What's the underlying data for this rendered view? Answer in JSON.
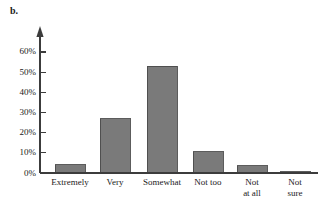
{
  "panel": {
    "label": "b."
  },
  "chart_data": {
    "type": "bar",
    "title": "",
    "subtitle": "",
    "xlabel": "",
    "ylabel": "",
    "categories": [
      "Extremely",
      "Very",
      "Somewhat",
      "Not too",
      "Not\nat all",
      "Not\nsure"
    ],
    "values": [
      4,
      27,
      53,
      10.5,
      3.5,
      0.7
    ],
    "value_labels": [
      "4%",
      "27%",
      "53%",
      "10.5%",
      "3.5%",
      "0.7%"
    ],
    "ylim": [
      0,
      65
    ],
    "ytick_values": [
      0,
      10,
      20,
      30,
      40,
      50,
      60
    ],
    "ytick_labels": [
      "0%",
      "10%",
      "20%",
      "30%",
      "40%",
      "50%",
      "60%"
    ],
    "grid": false,
    "legend": false,
    "legend_position": "none",
    "bar_color": "#7a7a7a",
    "bar_edge_color": "#4a4a4a",
    "axis_color": "#3c3c3c",
    "background_color": "#ffffff",
    "axis_arrow_top": true
  },
  "geometry": {
    "baseline_y": 173,
    "axis_x": 40,
    "axis_top_y": 28,
    "pixels_per_percent": 2.017,
    "bar_width": 30,
    "bar_centers": [
      70,
      115,
      162,
      208,
      252,
      295
    ],
    "tick_length": 6,
    "label_top_y": 177
  }
}
